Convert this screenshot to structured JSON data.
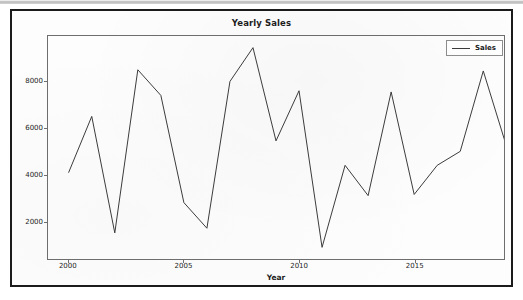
{
  "window": {
    "kind": "matplotlib-figure"
  },
  "chart_data": {
    "type": "line",
    "title": "Yearly Sales",
    "xlabel": "Year",
    "ylabel": "",
    "x": [
      2000,
      2001,
      2002,
      2003,
      2004,
      2005,
      2006,
      2007,
      2008,
      2009,
      2010,
      2011,
      2012,
      2013,
      2014,
      2015,
      2016,
      2017,
      2018
    ],
    "series": [
      {
        "name": "Sales",
        "color": "#3a3a3a",
        "values": [
          4100,
          6500,
          1500,
          8500,
          7400,
          2800,
          1700,
          8000,
          9450,
          5450,
          7600,
          880,
          4400,
          3100,
          7550,
          3150,
          4400,
          5000,
          8450
        ]
      }
    ],
    "trailing_point": 5500,
    "xlim": [
      1999.1,
      2018.9
    ],
    "ylim": [
      380,
      9950
    ],
    "xticks": [
      2000,
      2005,
      2010,
      2015
    ],
    "xtick_labels": [
      "2000",
      "2005",
      "2010",
      "2015"
    ],
    "yticks": [
      2000,
      4000,
      6000,
      8000
    ],
    "ytick_labels": [
      "2000",
      "4000",
      "6000",
      "8000"
    ],
    "grid": false,
    "legend_position": "upper right",
    "legend_entries": [
      "Sales"
    ]
  },
  "legend": {
    "label": "Sales"
  }
}
